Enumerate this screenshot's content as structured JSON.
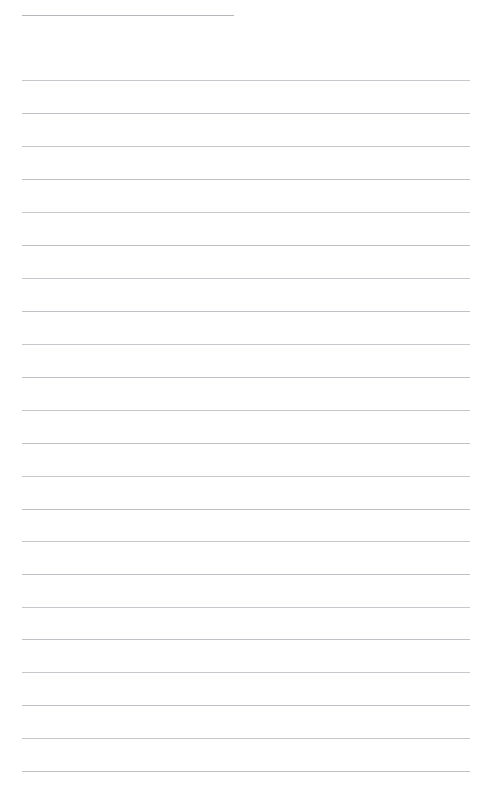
{
  "page": {
    "kind": "lined-paper",
    "background_color": "#ffffff",
    "rule_color": "#b9bdc2",
    "width_px": 491,
    "height_px": 796,
    "content_text": "",
    "placeholder": ""
  },
  "rules": {
    "count": 23,
    "left_margin_px": 22,
    "right_margin_px": 470,
    "items": [
      {
        "name": "title-rule",
        "y": 15,
        "x_start": 22,
        "x_end": 234,
        "short": true
      },
      {
        "name": "body-rule-1",
        "y": 80,
        "x_start": 22,
        "x_end": 470,
        "short": false
      },
      {
        "name": "body-rule-2",
        "y": 113,
        "x_start": 22,
        "x_end": 470,
        "short": false
      },
      {
        "name": "body-rule-3",
        "y": 146,
        "x_start": 22,
        "x_end": 470,
        "short": false
      },
      {
        "name": "body-rule-4",
        "y": 179,
        "x_start": 22,
        "x_end": 470,
        "short": false
      },
      {
        "name": "body-rule-5",
        "y": 212,
        "x_start": 22,
        "x_end": 470,
        "short": false
      },
      {
        "name": "body-rule-6",
        "y": 245,
        "x_start": 22,
        "x_end": 470,
        "short": false
      },
      {
        "name": "body-rule-7",
        "y": 278,
        "x_start": 22,
        "x_end": 470,
        "short": false
      },
      {
        "name": "body-rule-8",
        "y": 311,
        "x_start": 22,
        "x_end": 470,
        "short": false
      },
      {
        "name": "body-rule-9",
        "y": 344,
        "x_start": 22,
        "x_end": 470,
        "short": false
      },
      {
        "name": "body-rule-10",
        "y": 377,
        "x_start": 22,
        "x_end": 470,
        "short": false
      },
      {
        "name": "body-rule-11",
        "y": 410,
        "x_start": 22,
        "x_end": 470,
        "short": false
      },
      {
        "name": "body-rule-12",
        "y": 443,
        "x_start": 22,
        "x_end": 470,
        "short": false
      },
      {
        "name": "body-rule-13",
        "y": 476,
        "x_start": 22,
        "x_end": 470,
        "short": false
      },
      {
        "name": "body-rule-14",
        "y": 509,
        "x_start": 22,
        "x_end": 470,
        "short": false
      },
      {
        "name": "body-rule-15",
        "y": 541,
        "x_start": 22,
        "x_end": 470,
        "short": false
      },
      {
        "name": "body-rule-16",
        "y": 574,
        "x_start": 22,
        "x_end": 470,
        "short": false
      },
      {
        "name": "body-rule-17",
        "y": 607,
        "x_start": 22,
        "x_end": 470,
        "short": false
      },
      {
        "name": "body-rule-18",
        "y": 639,
        "x_start": 22,
        "x_end": 470,
        "short": false
      },
      {
        "name": "body-rule-19",
        "y": 672,
        "x_start": 22,
        "x_end": 470,
        "short": false
      },
      {
        "name": "body-rule-20",
        "y": 705,
        "x_start": 22,
        "x_end": 470,
        "short": false
      },
      {
        "name": "body-rule-21",
        "y": 738,
        "x_start": 22,
        "x_end": 470,
        "short": false
      },
      {
        "name": "body-rule-22",
        "y": 771,
        "x_start": 22,
        "x_end": 470,
        "short": false
      }
    ]
  }
}
